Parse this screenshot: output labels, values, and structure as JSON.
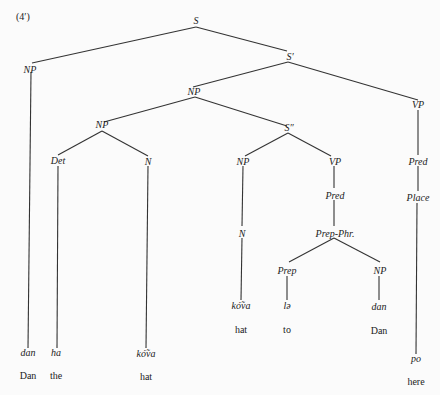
{
  "figure_label": "(4′)",
  "nodes": {
    "S": "S",
    "NP_subj": "NP",
    "S_prime": "S′",
    "NP_obj": "NP",
    "NP_inner": "NP",
    "Det": "Det",
    "N_head": "N",
    "S_dprime": "S″",
    "NP_rel": "NP",
    "N_rel": "N",
    "VP_rel": "VP",
    "Pred_rel": "Pred",
    "PrepPhr": "Prep-Phr.",
    "Prep": "Prep",
    "NP_prep": "NP",
    "VP_main": "VP",
    "Pred_main": "Pred",
    "Place": "Place"
  },
  "leaves": [
    {
      "word": "dan",
      "gloss": "Dan"
    },
    {
      "word": "ha",
      "gloss": "the"
    },
    {
      "word": "kó̃va",
      "gloss": "hat"
    },
    {
      "word": "kó̃va",
      "gloss": "hat"
    },
    {
      "word": "lə",
      "gloss": "to"
    },
    {
      "word": "dan",
      "gloss": "Dan"
    },
    {
      "word": "po",
      "gloss": "here"
    }
  ]
}
